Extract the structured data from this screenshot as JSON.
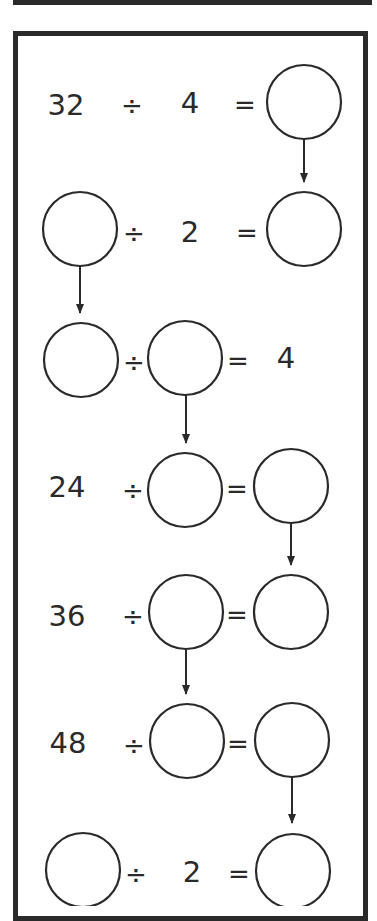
{
  "worksheet": {
    "operation": "division chain",
    "colors": {
      "ink": "#2a2a2a",
      "background": "#ffffff"
    },
    "rows": [
      {
        "a": "32",
        "op": "÷",
        "b": "4",
        "eq": "=",
        "result": ""
      },
      {
        "a": "",
        "op": "÷",
        "b": "2",
        "eq": "=",
        "result": ""
      },
      {
        "a": "",
        "op": "÷",
        "b": "",
        "eq": "=",
        "result": "4"
      },
      {
        "a": "24",
        "op": "÷",
        "b": "",
        "eq": "=",
        "result": ""
      },
      {
        "a": "36",
        "op": "÷",
        "b": "",
        "eq": "=",
        "result": ""
      },
      {
        "a": "48",
        "op": "÷",
        "b": "",
        "eq": "=",
        "result": ""
      },
      {
        "a": "",
        "op": "÷",
        "b": "2",
        "eq": "=",
        "result": ""
      }
    ],
    "arrows": [
      {
        "from": "row1.result",
        "to": "row2.result"
      },
      {
        "from": "row2.a",
        "to": "row3.a"
      },
      {
        "from": "row3.b",
        "to": "row4.b"
      },
      {
        "from": "row4.result",
        "to": "row5.result"
      },
      {
        "from": "row5.b",
        "to": "row6.b"
      },
      {
        "from": "row6.result",
        "to": "row7.result"
      }
    ]
  }
}
